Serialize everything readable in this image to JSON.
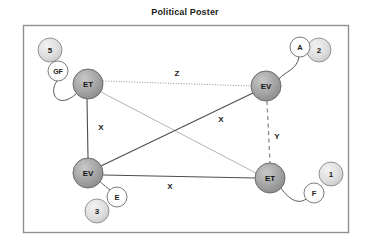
{
  "title": "Political Poster",
  "frame": {
    "x": 23,
    "y": 25,
    "width": 326,
    "height": 208,
    "border_color": "#808080",
    "background": "#ffffff"
  },
  "colors": {
    "main_node_fill": "#a0a0a0",
    "main_node_stroke": "#5a5a5a",
    "main_node_text": "#1b1b1b",
    "secondary_node_fill": "#d9d9d9",
    "secondary_node_stroke": "#7a7a7a",
    "white_node_fill": "#ffffff",
    "white_node_stroke": "#6e6e6e",
    "edge_solid": "#4d4d4d",
    "edge_light": "#b0b0b0",
    "edge_dotted": "#8c8c8c",
    "edge_dashed": "#8c8c8c",
    "label_text": "#1b1b1b",
    "title_text": "#1b1b1b"
  },
  "graph": {
    "main_nodes": [
      {
        "id": "et-top-left",
        "label": "ET",
        "cx": 88,
        "cy": 84,
        "r": 15
      },
      {
        "id": "ev-top-right",
        "label": "EV",
        "cx": 266,
        "cy": 86,
        "r": 15
      },
      {
        "id": "ev-bottom-left",
        "label": "EV",
        "cx": 88,
        "cy": 173,
        "r": 15
      },
      {
        "id": "et-bottom-right",
        "label": "ET",
        "cx": 270,
        "cy": 178,
        "r": 15
      }
    ],
    "secondary_nodes": [
      {
        "id": "node-5",
        "label": "5",
        "cx": 50,
        "cy": 50,
        "r": 12,
        "style": "gray"
      },
      {
        "id": "node-gf",
        "label": "GF",
        "cx": 58,
        "cy": 71,
        "r": 10,
        "style": "white"
      },
      {
        "id": "node-a",
        "label": "A",
        "cx": 300,
        "cy": 47,
        "r": 10,
        "style": "white"
      },
      {
        "id": "node-2",
        "label": "2",
        "cx": 319,
        "cy": 50,
        "r": 12,
        "style": "gray"
      },
      {
        "id": "node-1",
        "label": "1",
        "cx": 331,
        "cy": 174,
        "r": 12,
        "style": "gray"
      },
      {
        "id": "node-f",
        "label": "F",
        "cx": 314,
        "cy": 193,
        "r": 10,
        "style": "white"
      },
      {
        "id": "node-e",
        "label": "E",
        "cx": 117,
        "cy": 197,
        "r": 10,
        "style": "white"
      },
      {
        "id": "node-3",
        "label": "3",
        "cx": 97,
        "cy": 211,
        "r": 12,
        "style": "gray"
      }
    ],
    "edges": [
      {
        "id": "edge-z",
        "from": "et-top-left",
        "to": "ev-top-right",
        "label": "Z",
        "style": "dotted",
        "lx": 177,
        "ly": 74
      },
      {
        "id": "edge-x-left",
        "from": "et-top-left",
        "to": "ev-bottom-left",
        "label": "X",
        "style": "solid",
        "lx": 100,
        "ly": 127
      },
      {
        "id": "edge-x-diag",
        "from": "ev-bottom-left",
        "to": "ev-top-right",
        "label": "X",
        "style": "solid",
        "lx": 221,
        "ly": 119
      },
      {
        "id": "edge-cross",
        "from": "et-top-left",
        "to": "et-bottom-right",
        "label": "",
        "style": "light",
        "lx": 0,
        "ly": 0
      },
      {
        "id": "edge-y",
        "from": "ev-top-right",
        "to": "et-bottom-right",
        "label": "Y",
        "style": "dashed",
        "lx": 277,
        "ly": 136
      },
      {
        "id": "edge-x-bottom",
        "from": "ev-bottom-left",
        "to": "et-bottom-right",
        "label": "X",
        "style": "solid",
        "lx": 170,
        "ly": 186
      }
    ],
    "leaf_connectors": [
      {
        "id": "connector-gf-et",
        "path": "M 58 81 C 50 92, 60 108, 76 94"
      },
      {
        "id": "connector-a-ev",
        "path": "M 299 57 C 296 70, 283 71, 279 79"
      },
      {
        "id": "connector-f-et",
        "path": "M 306 199 C 297 205, 286 195, 281 187"
      },
      {
        "id": "connector-e-ev",
        "path": "M 110 191 C 104 185, 101 182, 98 181"
      }
    ]
  }
}
